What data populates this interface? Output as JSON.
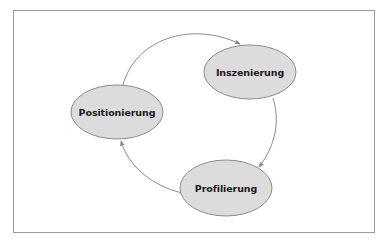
{
  "diagram": {
    "type": "cycle",
    "nodes": [
      {
        "id": "inszenierung",
        "label": "Inszenierung",
        "cx": 250,
        "cy": 72,
        "rx": 46,
        "ry": 27
      },
      {
        "id": "positionierung",
        "label": "Positionierung",
        "cx": 117,
        "cy": 112,
        "rx": 46,
        "ry": 27
      },
      {
        "id": "profilierung",
        "label": "Profilierung",
        "cx": 226,
        "cy": 188,
        "rx": 46,
        "ry": 28
      }
    ],
    "edges": [
      {
        "from": "positionierung",
        "to": "inszenierung"
      },
      {
        "from": "inszenierung",
        "to": "profilierung"
      },
      {
        "from": "profilierung",
        "to": "positionierung"
      }
    ],
    "colors": {
      "node_fill": "#dcdcdc",
      "node_stroke": "#8a8a8a",
      "edge": "#8a8a8a",
      "frame": "#9a9a9a",
      "text": "#1a1a1a"
    }
  }
}
